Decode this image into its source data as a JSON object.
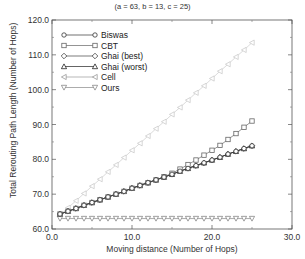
{
  "chart_data": {
    "type": "line",
    "title": "",
    "subtitle": "(a = 63, b = 13, c = 25)",
    "xlabel": "Moving distance (Number of Hops)",
    "ylabel": "Total Rerouting Path Length (Number of Hops)",
    "xlim": [
      0,
      30
    ],
    "ylim": [
      60,
      120
    ],
    "xticks": [
      "0.0",
      "10.0",
      "20.0",
      "30.0"
    ],
    "yticks": [
      "60.0",
      "70.0",
      "80.0",
      "90.0",
      "100.0",
      "110.0",
      "120.0"
    ],
    "grid": false,
    "legend_position": "upper left",
    "x": [
      1,
      2,
      3,
      4,
      5,
      6,
      7,
      8,
      9,
      10,
      11,
      12,
      13,
      14,
      15,
      16,
      17,
      18,
      19,
      20,
      21,
      22,
      23,
      24,
      25
    ],
    "series": [
      {
        "name": "Biswas",
        "marker": "circle",
        "color": "#333333",
        "values": [
          64.3,
          65.1,
          65.9,
          66.8,
          67.6,
          68.4,
          69.2,
          70.0,
          70.8,
          71.7,
          72.5,
          73.3,
          74.1,
          74.9,
          75.7,
          76.6,
          77.4,
          78.2,
          79.0,
          79.8,
          80.6,
          81.5,
          82.3,
          83.1,
          83.9
        ]
      },
      {
        "name": "CBT",
        "marker": "square",
        "color": "#666666",
        "values": [
          64.3,
          65.1,
          65.9,
          66.8,
          67.6,
          68.4,
          69.2,
          70.0,
          70.8,
          71.7,
          72.5,
          73.3,
          74.1,
          75.0,
          76.0,
          77.2,
          78.5,
          79.8,
          81.2,
          82.6,
          84.0,
          85.7,
          87.4,
          89.2,
          91.0
        ]
      },
      {
        "name": "Ghai (best)",
        "marker": "diamond",
        "color": "#444444",
        "values": [
          64.3,
          65.1,
          65.9,
          66.8,
          67.6,
          68.4,
          69.2,
          70.0,
          70.8,
          71.7,
          72.5,
          73.3,
          74.1,
          74.9,
          75.7,
          76.6,
          77.4,
          78.2,
          79.0,
          79.8,
          80.6,
          81.5,
          82.3,
          83.1,
          83.9
        ]
      },
      {
        "name": "Ghai (worst)",
        "marker": "triangle-up",
        "color": "#222222",
        "values": [
          64.3,
          65.1,
          65.9,
          66.8,
          67.6,
          68.4,
          69.2,
          70.0,
          70.8,
          71.7,
          72.5,
          73.3,
          74.1,
          74.9,
          75.7,
          76.6,
          77.4,
          78.2,
          79.0,
          79.8,
          80.6,
          81.5,
          82.3,
          83.1,
          83.9
        ]
      },
      {
        "name": "Cell",
        "marker": "triangle-left",
        "color": "#cccccc",
        "values": [
          64.0,
          66.1,
          68.1,
          70.2,
          72.3,
          74.3,
          76.4,
          78.4,
          80.5,
          82.6,
          84.6,
          86.7,
          88.8,
          90.8,
          92.9,
          94.9,
          97.0,
          99.1,
          101.1,
          103.2,
          105.3,
          107.3,
          109.4,
          111.4,
          113.5
        ]
      },
      {
        "name": "Ours",
        "marker": "triangle-down",
        "color": "#888888",
        "values": [
          63,
          63,
          63,
          63,
          63,
          63,
          63,
          63,
          63,
          63,
          63,
          63,
          63,
          63,
          63,
          63,
          63,
          63,
          63,
          63,
          63,
          63,
          63,
          63,
          63
        ]
      }
    ]
  }
}
